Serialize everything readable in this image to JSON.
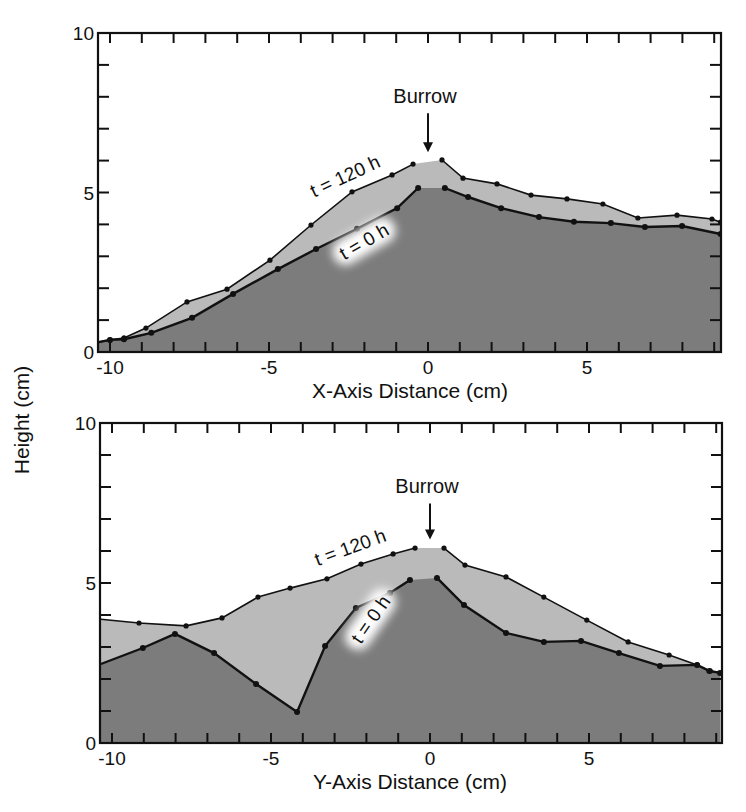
{
  "figure": {
    "shared_ylabel": "Height (cm)",
    "colors": {
      "t0_fill": "#7c7c7c",
      "t120_fill": "#bababa",
      "line": "#111111",
      "frame": "#111111",
      "glow": "#ffffff"
    }
  },
  "chart_data": [
    {
      "type": "area",
      "title": "",
      "xlabel": "X-Axis Distance (cm)",
      "ylabel": "Height (cm)",
      "xlim": [
        -10.4,
        9.2
      ],
      "ylim": [
        0,
        10
      ],
      "xticks": [
        -10,
        -5,
        0,
        5
      ],
      "yticks": [
        0,
        5,
        10
      ],
      "grid": false,
      "annotations": [
        {
          "text": "Burrow",
          "x": 0,
          "y": 7.8,
          "arrow_to_y": 6.2
        },
        {
          "text": "t = 120 h",
          "x": -2.6,
          "y": 5.5,
          "rotation": -25
        },
        {
          "text": "t = 0 h",
          "x": -2.0,
          "y": 3.45,
          "rotation": -30,
          "glow": true
        }
      ],
      "series": [
        {
          "name": "t = 120 h",
          "points": [
            [
              -10.4,
              0.3
            ],
            [
              -10.0,
              0.38
            ],
            [
              -9.56,
              0.44
            ],
            [
              -8.87,
              0.75
            ],
            [
              -7.58,
              1.57
            ],
            [
              -6.32,
              1.97
            ],
            [
              -4.97,
              2.88
            ],
            [
              -3.68,
              3.98
            ],
            [
              -2.39,
              5.02
            ],
            [
              -1.13,
              5.55
            ],
            [
              -0.47,
              5.89
            ],
            [
              0.44,
              6.02
            ],
            [
              1.1,
              5.45
            ],
            [
              2.17,
              5.27
            ],
            [
              3.24,
              4.92
            ],
            [
              4.37,
              4.8
            ],
            [
              5.5,
              4.64
            ],
            [
              6.6,
              4.2
            ],
            [
              7.83,
              4.29
            ],
            [
              8.93,
              4.17
            ],
            [
              9.2,
              4.07
            ]
          ]
        },
        {
          "name": "t = 0 h",
          "points": [
            [
              -10.4,
              0.3
            ],
            [
              -10.0,
              0.38
            ],
            [
              -9.56,
              0.4
            ],
            [
              -8.7,
              0.6
            ],
            [
              -7.42,
              1.07
            ],
            [
              -6.13,
              1.82
            ],
            [
              -4.72,
              2.6
            ],
            [
              -3.52,
              3.23
            ],
            [
              -2.23,
              3.86
            ],
            [
              -0.97,
              4.51
            ],
            [
              -0.31,
              5.14
            ],
            [
              0.53,
              5.14
            ],
            [
              1.26,
              4.86
            ],
            [
              2.3,
              4.51
            ],
            [
              3.49,
              4.23
            ],
            [
              4.59,
              4.08
            ],
            [
              5.75,
              4.04
            ],
            [
              6.82,
              3.92
            ],
            [
              7.99,
              3.95
            ],
            [
              9.2,
              3.7
            ]
          ]
        }
      ],
      "plot_box": {
        "left": 98,
        "top": 33,
        "right": 721,
        "bottom": 352,
        "x_zero_px": 428,
        "px_per_cm_x": 31.8
      }
    },
    {
      "type": "area",
      "title": "",
      "xlabel": "Y-Axis Distance (cm)",
      "ylabel": "Height (cm)",
      "xlim": [
        -10.35,
        9.18
      ],
      "ylim": [
        0,
        10
      ],
      "xticks": [
        -10,
        -5,
        0,
        5
      ],
      "yticks": [
        0,
        5,
        10
      ],
      "grid": false,
      "annotations": [
        {
          "text": "Burrow",
          "x": 0,
          "y": 7.8,
          "arrow_to_y": 6.3
        },
        {
          "text": "t = 120 h",
          "x": -2.5,
          "y": 6.1,
          "rotation": -20
        },
        {
          "text": "t = 0 h",
          "x": -1.85,
          "y": 3.85,
          "rotation": -55,
          "glow": true
        }
      ],
      "series": [
        {
          "name": "t = 120 h",
          "points": [
            [
              -10.35,
              3.87
            ],
            [
              -9.15,
              3.75
            ],
            [
              -7.67,
              3.66
            ],
            [
              -6.54,
              3.91
            ],
            [
              -5.41,
              4.56
            ],
            [
              -4.4,
              4.84
            ],
            [
              -3.24,
              5.13
            ],
            [
              -2.17,
              5.59
            ],
            [
              -1.16,
              5.91
            ],
            [
              -0.47,
              6.09
            ],
            [
              0.44,
              6.09
            ],
            [
              1.1,
              5.56
            ],
            [
              2.39,
              5.19
            ],
            [
              3.58,
              4.56
            ],
            [
              4.93,
              3.84
            ],
            [
              6.23,
              3.16
            ],
            [
              7.52,
              2.75
            ],
            [
              8.4,
              2.44
            ],
            [
              8.77,
              2.25
            ],
            [
              9.18,
              2.19
            ]
          ]
        },
        {
          "name": "t = 0 h",
          "points": [
            [
              -10.35,
              2.47
            ],
            [
              -9.03,
              2.97
            ],
            [
              -8.02,
              3.41
            ],
            [
              -6.79,
              2.81
            ],
            [
              -5.47,
              1.84
            ],
            [
              -4.18,
              0.97
            ],
            [
              -3.3,
              3.03
            ],
            [
              -2.33,
              4.22
            ],
            [
              -1.26,
              4.69
            ],
            [
              -0.63,
              5.09
            ],
            [
              0.22,
              5.16
            ],
            [
              1.07,
              4.31
            ],
            [
              2.39,
              3.44
            ],
            [
              3.58,
              3.16
            ],
            [
              4.75,
              3.19
            ],
            [
              5.94,
              2.81
            ],
            [
              7.23,
              2.41
            ],
            [
              8.4,
              2.44
            ],
            [
              8.8,
              2.25
            ],
            [
              9.12,
              2.19
            ]
          ]
        }
      ],
      "plot_box": {
        "left": 100,
        "top": 423,
        "right": 722,
        "bottom": 743,
        "x_zero_px": 430,
        "px_per_cm_x": 31.8
      }
    }
  ]
}
